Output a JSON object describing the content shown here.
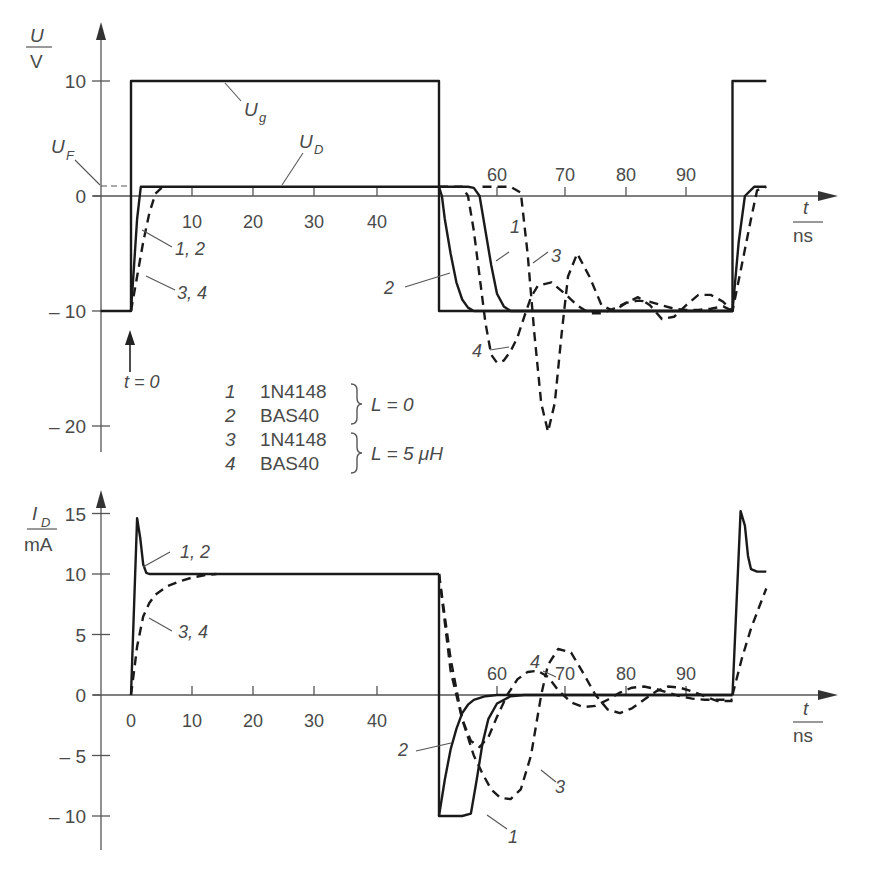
{
  "chart_data": [
    {
      "type": "line",
      "title": "Diode switching voltage U_D vs time",
      "ylabel_num": "U",
      "ylabel_den": "V",
      "xlabel_num": "t",
      "xlabel_den": "ns",
      "ylim": [
        -22,
        14
      ],
      "xlim": [
        -5,
        103
      ],
      "grid": false,
      "y_ticks": [
        10,
        0,
        -10,
        -20
      ],
      "y_tick_labels": [
        "10",
        "0",
        "– 10",
        "– 20"
      ],
      "x_ticks": [
        10,
        20,
        30,
        40,
        60,
        70,
        80,
        90
      ],
      "x_tick_labels": [
        "10",
        "20",
        "30",
        "40",
        "60",
        "70",
        "80",
        "90"
      ],
      "annotations": {
        "Ug": "U",
        "Ug_sub": "g",
        "UD": "U",
        "UD_sub": "D",
        "UF": "U",
        "UF_sub": "F",
        "t0": "t = 0",
        "label_12": "1, 2",
        "label_34": "3, 4",
        "label_1": "1",
        "label_2": "2",
        "label_3": "3",
        "label_4": "4"
      },
      "series": [
        {
          "name": "U_g (generator)",
          "style": "solid",
          "x": [
            -5,
            0,
            0,
            50,
            50,
            97.5,
            97.5,
            103
          ],
          "y": [
            -10,
            -10,
            10,
            10,
            -10,
            -10,
            10,
            10
          ]
        },
        {
          "name": "1, 2 (L = 0) rise",
          "style": "solid",
          "x": [
            0,
            0.5,
            1,
            1.6,
            2,
            50
          ],
          "y": [
            -10,
            -6,
            -2,
            0.8,
            0.8,
            0.8
          ]
        },
        {
          "name": "3, 4 (L = 5 uH) rise",
          "style": "dashed",
          "x": [
            0,
            1,
            2,
            3,
            4,
            5,
            6
          ],
          "y": [
            -10,
            -7,
            -4,
            -1.5,
            0.2,
            0.7,
            0.8
          ]
        },
        {
          "name": "1 1N4148 (L = 0) fall",
          "style": "solid",
          "x": [
            50,
            55,
            56,
            57,
            58,
            59,
            60,
            61,
            62,
            97.5,
            98.5,
            99.5,
            101,
            103
          ],
          "y": [
            0.8,
            0.8,
            0.7,
            0,
            -3,
            -6,
            -8.5,
            -9.6,
            -10,
            -10,
            -4,
            0,
            0.8,
            0.8
          ]
        },
        {
          "name": "2 BAS40 (L = 0) fall",
          "style": "solid",
          "x": [
            50,
            50.5,
            51,
            52,
            53,
            54,
            55,
            56,
            57,
            97.5
          ],
          "y": [
            0.8,
            0,
            -2,
            -5,
            -7.5,
            -9,
            -9.7,
            -10,
            -10,
            -10
          ]
        },
        {
          "name": "3 1N4148 (L = 5 uH)",
          "style": "dashed",
          "x": [
            57.5,
            62,
            63.5,
            64.5,
            65.5,
            66.5,
            67.5,
            68.5,
            69.5,
            70.5,
            72,
            74,
            76,
            78,
            80,
            82,
            84,
            86,
            88,
            90,
            92,
            94,
            96,
            97.5,
            99,
            100.5,
            101.5,
            103
          ],
          "y": [
            0.8,
            0.8,
            0.3,
            -5,
            -12,
            -18,
            -20.5,
            -18,
            -12,
            -7,
            -5,
            -7,
            -9.5,
            -10,
            -9.3,
            -8.8,
            -9.5,
            -10.7,
            -10.5,
            -9.5,
            -8.6,
            -8.6,
            -9.2,
            -10,
            -6,
            -2,
            0.5,
            0.8
          ]
        },
        {
          "name": "4 BAS40 (L = 5 uH)",
          "style": "dashed",
          "x": [
            50,
            54,
            55,
            56,
            57,
            58,
            59,
            60,
            61,
            62,
            63,
            64,
            65,
            66,
            68,
            70,
            72,
            74,
            76,
            78,
            80,
            82,
            84,
            86,
            88,
            90,
            92,
            94,
            96,
            97.5
          ],
          "y": [
            0.8,
            0.8,
            0,
            -3,
            -7,
            -11,
            -13.8,
            -14.5,
            -14.3,
            -13.5,
            -12.3,
            -10.5,
            -8.8,
            -7.8,
            -7.5,
            -8.5,
            -9.5,
            -10.2,
            -10.2,
            -9.8,
            -9.3,
            -9.1,
            -9.2,
            -9.5,
            -9.8,
            -9.9,
            -9.9,
            -9.8,
            -9.6,
            -10
          ]
        }
      ],
      "legend": [
        {
          "num": "1",
          "device": "1N4148"
        },
        {
          "num": "2",
          "device": "BAS40"
        },
        {
          "num": "3",
          "device": "1N4148"
        },
        {
          "num": "4",
          "device": "BAS40"
        }
      ],
      "legend_groups": [
        {
          "members": [
            "1",
            "2"
          ],
          "condition": "L = 0"
        },
        {
          "members": [
            "3",
            "4"
          ],
          "condition": "L = 5 μH"
        }
      ]
    },
    {
      "type": "line",
      "title": "Diode current I_D vs time",
      "ylabel_num": "I",
      "ylabel_num_sub": "D",
      "ylabel_den": "mA",
      "xlabel_num": "t",
      "xlabel_den": "ns",
      "ylim": [
        -12,
        17
      ],
      "xlim": [
        -5,
        103
      ],
      "grid": false,
      "y_ticks": [
        15,
        10,
        5,
        0,
        -5,
        -10
      ],
      "y_tick_labels": [
        "15",
        "10",
        "5",
        "0",
        "– 5",
        "– 10"
      ],
      "x_ticks": [
        0,
        10,
        20,
        30,
        40,
        60,
        70,
        80,
        90
      ],
      "x_tick_labels": [
        "0",
        "10",
        "20",
        "30",
        "40",
        "60",
        "70",
        "80",
        "90"
      ],
      "annotations": {
        "label_12": "1, 2",
        "label_34": "3, 4",
        "label_1": "1",
        "label_2": "2",
        "label_3": "3",
        "label_4": "4"
      },
      "series": [
        {
          "name": "1, 2 (L = 0)",
          "style": "solid",
          "x": [
            0,
            1,
            1.5,
            2,
            2.5,
            3,
            4,
            50
          ],
          "y": [
            0,
            14.6,
            13,
            10.8,
            10.1,
            10,
            10,
            10
          ]
        },
        {
          "name": "3, 4 (L = 5 uH) rise",
          "style": "dashed",
          "x": [
            0,
            0.5,
            1,
            2,
            3,
            4,
            6,
            8,
            10,
            12,
            14
          ],
          "y": [
            0,
            2,
            4,
            6.5,
            7.6,
            8.3,
            9,
            9.4,
            9.7,
            9.9,
            10
          ]
        },
        {
          "name": "1 1N4148 (L = 0)",
          "style": "solid",
          "x": [
            50,
            50,
            54,
            55.5,
            56.5,
            57.5,
            58.5,
            60,
            62,
            64,
            97.5
          ],
          "y": [
            10,
            -10,
            -10,
            -9.8,
            -7,
            -4,
            -2,
            -0.7,
            -0.1,
            0,
            0
          ]
        },
        {
          "name": "2 BAS40 (L = 0)",
          "style": "solid",
          "x": [
            50,
            51,
            52,
            53,
            54,
            55,
            56,
            58,
            60,
            97.5
          ],
          "y": [
            -10,
            -7,
            -4.5,
            -2.8,
            -1.5,
            -0.8,
            -0.4,
            -0.1,
            0,
            0
          ]
        },
        {
          "name": "3 1N4148 (L = 5 uH)",
          "style": "dashed",
          "x": [
            50,
            52,
            54,
            56,
            57.5,
            59,
            60.5,
            62,
            63.5,
            65,
            66.5,
            67.5,
            69,
            71,
            73,
            75,
            77,
            79,
            81,
            83,
            85,
            87,
            89,
            91,
            93,
            95,
            97.5
          ],
          "y": [
            10,
            3,
            -2,
            -5,
            -6.5,
            -7.8,
            -8.5,
            -8.6,
            -7.8,
            -5,
            0,
            2.5,
            3.8,
            3.5,
            1.8,
            0,
            -1.2,
            -1.5,
            -1.1,
            -0.4,
            0.3,
            0.7,
            0.6,
            0.3,
            -0.1,
            -0.5,
            -0.5
          ]
        },
        {
          "name": "4 BAS40 (L = 5 uH)",
          "style": "dashed",
          "x": [
            50,
            52,
            54,
            55.5,
            57,
            58.5,
            60,
            61.5,
            63,
            64.5,
            66,
            67.5,
            69,
            71,
            73,
            75,
            77,
            79,
            81,
            83,
            85,
            87,
            89,
            91,
            93,
            95,
            97.5
          ],
          "y": [
            10,
            2,
            -2,
            -3.8,
            -4.3,
            -3.5,
            -1.8,
            0,
            1.3,
            1.9,
            2,
            1.5,
            0.4,
            -0.6,
            -1,
            -0.9,
            -0.4,
            0.2,
            0.6,
            0.7,
            0.5,
            0.2,
            -0.1,
            -0.3,
            -0.4,
            -0.4,
            -0.4
          ]
        },
        {
          "name": "1, 2 (L = 0) second pulse",
          "style": "solid",
          "x": [
            97.5,
            98.8,
            99.5,
            100,
            100.5,
            101.5,
            103
          ],
          "y": [
            0,
            15.2,
            14,
            11.5,
            10.4,
            10.2,
            10.2
          ]
        },
        {
          "name": "3, 4 (L = 5 uH) second pulse",
          "style": "dashed",
          "x": [
            97.5,
            99,
            100.5,
            102,
            103
          ],
          "y": [
            0,
            3,
            5.5,
            7.5,
            8.8
          ]
        }
      ]
    }
  ]
}
